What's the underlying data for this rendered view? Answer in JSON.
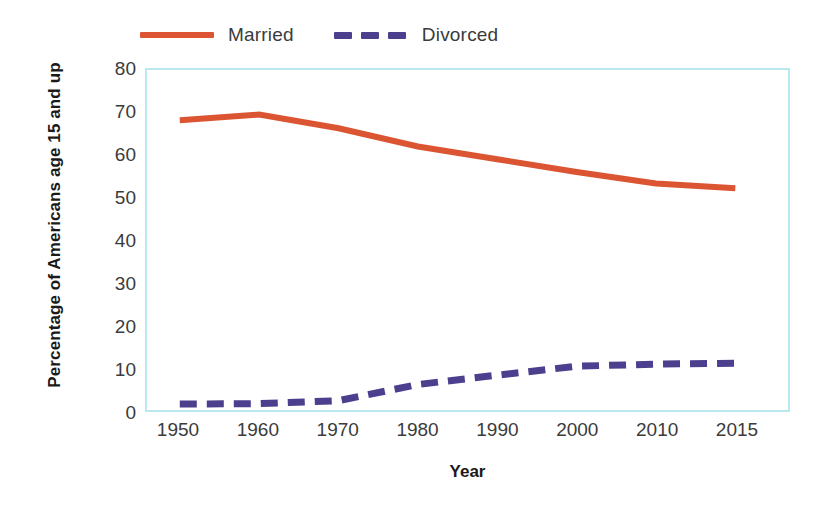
{
  "chart_data": {
    "type": "line",
    "title": "",
    "xlabel": "Year",
    "ylabel": "Percentage of Americans age 15 and up",
    "categories": [
      "1950",
      "1960",
      "1970",
      "1980",
      "1990",
      "2000",
      "2010",
      "2015"
    ],
    "ylim": [
      0,
      80
    ],
    "yticks": [
      "0",
      "10",
      "20",
      "30",
      "40",
      "50",
      "60",
      "70",
      "80"
    ],
    "grid": false,
    "legend_position": "top",
    "series": [
      {
        "name": "Married",
        "color": "#dc5533",
        "style": "solid",
        "values": [
          68.2,
          69.5,
          66.3,
          62.0,
          59.0,
          56.0,
          53.3,
          52.2
        ]
      },
      {
        "name": "Divorced",
        "color": "#4b3f8e",
        "style": "dashed",
        "values": [
          1.4,
          1.5,
          2.2,
          6.0,
          8.2,
          10.3,
          10.8,
          11.0
        ]
      }
    ]
  },
  "legend": {
    "entries": [
      {
        "label": "Married"
      },
      {
        "label": "Divorced"
      }
    ]
  },
  "axes": {
    "x_title": "Year",
    "y_title": "Percentage of Americans age 15 and up"
  },
  "colors": {
    "married_line": "#dc5533",
    "divorced_line": "#4b3f8e",
    "plot_border": "#b7e9ee",
    "tick_text": "#3b3b3b",
    "title_text": "#1a1a1a",
    "background": "#ffffff"
  }
}
